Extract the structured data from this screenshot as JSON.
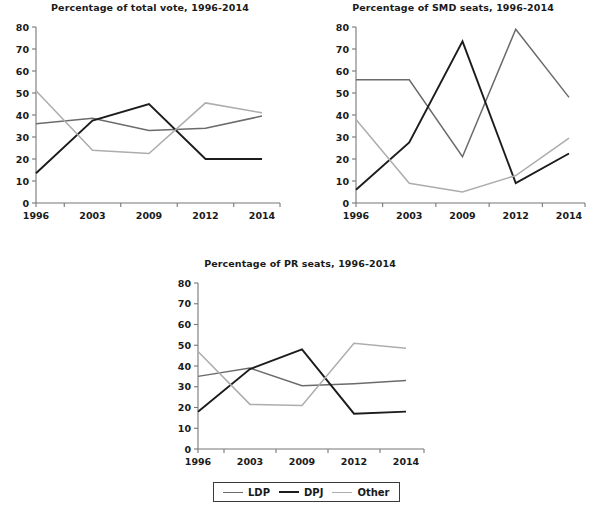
{
  "figure": {
    "background": "#ffffff",
    "axis_color": "#777777"
  },
  "legend": {
    "position": "bottom-center",
    "items": [
      {
        "label": "LDP",
        "color": "#6b6b6b"
      },
      {
        "label": "DPJ",
        "color": "#1c1c1c"
      },
      {
        "label": "Other",
        "color": "#adadad"
      }
    ]
  },
  "chart_data": [
    {
      "type": "line",
      "title": "Percentage of total vote, 1996-2014",
      "xlabel": "",
      "ylabel": "",
      "categories": [
        "1996",
        "2003",
        "2009",
        "2012",
        "2014"
      ],
      "x": [
        1996,
        2003,
        2009,
        2012,
        2014
      ],
      "ylim": [
        0,
        80
      ],
      "yticks": [
        0,
        10,
        20,
        30,
        40,
        50,
        60,
        70,
        80
      ],
      "grid": false,
      "legend_position": "figure-bottom",
      "series": [
        {
          "name": "LDP",
          "color": "#6b6b6b",
          "values": [
            36.0,
            38.5,
            33.0,
            34.0,
            39.5
          ]
        },
        {
          "name": "DPJ",
          "color": "#1c1c1c",
          "values": [
            13.5,
            37.5,
            45.0,
            20.0,
            20.0
          ]
        },
        {
          "name": "Other",
          "color": "#adadad",
          "values": [
            51.0,
            24.0,
            22.5,
            45.5,
            41.0
          ]
        }
      ]
    },
    {
      "type": "line",
      "title": "Percentage of SMD seats, 1996-2014",
      "xlabel": "",
      "ylabel": "",
      "categories": [
        "1996",
        "2003",
        "2009",
        "2012",
        "2014"
      ],
      "x": [
        1996,
        2003,
        2009,
        2012,
        2014
      ],
      "ylim": [
        0,
        80
      ],
      "yticks": [
        0,
        10,
        20,
        30,
        40,
        50,
        60,
        70,
        80
      ],
      "grid": false,
      "legend_position": "figure-bottom",
      "series": [
        {
          "name": "LDP",
          "color": "#6b6b6b",
          "values": [
            56.0,
            56.0,
            21.0,
            79.0,
            48.0
          ]
        },
        {
          "name": "DPJ",
          "color": "#1c1c1c",
          "values": [
            6.0,
            27.5,
            73.5,
            9.0,
            22.5
          ]
        },
        {
          "name": "Other",
          "color": "#adadad",
          "values": [
            38.0,
            9.0,
            5.0,
            12.5,
            29.5
          ]
        }
      ]
    },
    {
      "type": "line",
      "title": "Percentage of PR seats, 1996-2014",
      "xlabel": "",
      "ylabel": "",
      "categories": [
        "1996",
        "2003",
        "2009",
        "2012",
        "2014"
      ],
      "x": [
        1996,
        2003,
        2009,
        2012,
        2014
      ],
      "ylim": [
        0,
        80
      ],
      "yticks": [
        0,
        10,
        20,
        30,
        40,
        50,
        60,
        70,
        80
      ],
      "grid": false,
      "legend_position": "figure-bottom",
      "series": [
        {
          "name": "LDP",
          "color": "#6b6b6b",
          "values": [
            35.0,
            39.0,
            30.5,
            31.5,
            33.0
          ]
        },
        {
          "name": "DPJ",
          "color": "#1c1c1c",
          "values": [
            18.0,
            38.5,
            48.0,
            17.0,
            18.0
          ]
        },
        {
          "name": "Other",
          "color": "#adadad",
          "values": [
            47.0,
            21.5,
            21.0,
            51.0,
            48.5
          ]
        }
      ]
    }
  ]
}
